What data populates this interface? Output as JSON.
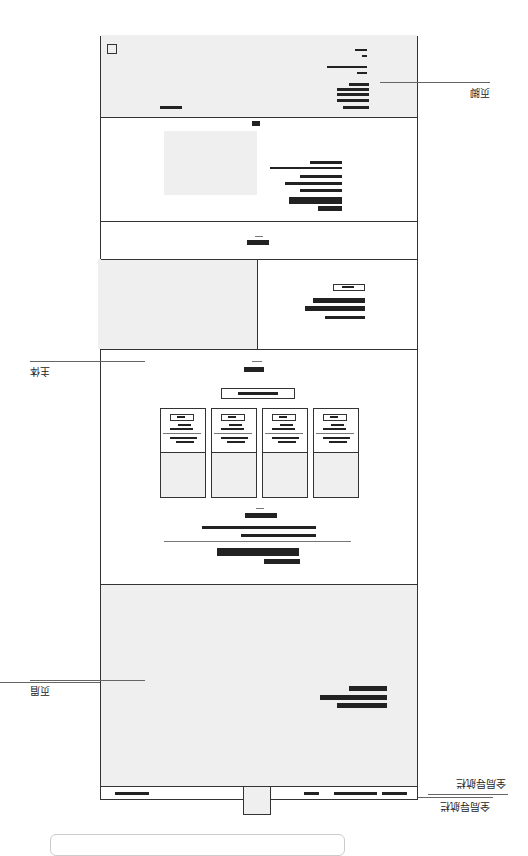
{
  "diagram": {
    "orientation": "rotated-180",
    "annotations": {
      "global_nav": "全局导航栏",
      "header": "页眉",
      "body": "主体",
      "footer": "页脚"
    },
    "sections": [
      "global-nav",
      "header-hero",
      "body-nav-strip",
      "body-feature-split",
      "body-pricing-cards",
      "body-title-strip",
      "body-media-text",
      "footer-links",
      "footer-bottom"
    ],
    "card_count": 4
  }
}
